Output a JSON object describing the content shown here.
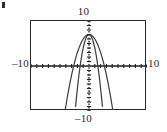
{
  "figure": {
    "kind": "graphing-calculator-viewport",
    "corner_mark": "tick-mark"
  },
  "labels": {
    "top": "10",
    "bottom": "–10",
    "left": "–10",
    "right": "10"
  },
  "chart_data": {
    "type": "line",
    "title": "",
    "subtitle": "",
    "xlabel": "",
    "ylabel": "",
    "xlim": [
      -10,
      10
    ],
    "ylim": [
      -10,
      10
    ],
    "grid": false,
    "legend": "none",
    "axis_style": "dotted-ticks",
    "tick_labels": {
      "x": [
        "–10",
        "10"
      ],
      "y": [
        "–10",
        "10"
      ]
    },
    "axes_drawn": [
      "x-axis at y=0 (solid with tick dots)",
      "y-axis at x=0 (dotted)"
    ],
    "annotations": [],
    "series": [
      {
        "name": "wide parabola",
        "equation": "y = -x^2 + 7",
        "vertex": [
          0,
          7
        ],
        "leading_coefficient": -1,
        "x": [
          -4.1,
          -3.5,
          -3.0,
          -2.5,
          -2.0,
          -1.5,
          -1.0,
          -0.5,
          0.0,
          0.5,
          1.0,
          1.5,
          2.0,
          2.5,
          3.0,
          3.5,
          4.1
        ],
        "values": [
          -9.8,
          -5.3,
          -2.0,
          0.8,
          3.0,
          4.8,
          6.0,
          6.8,
          7.0,
          6.8,
          6.0,
          4.8,
          3.0,
          0.8,
          -2.0,
          -5.3,
          -9.8
        ]
      },
      {
        "name": "narrow parabola",
        "equation": "y = -3x^2 + 7",
        "vertex": [
          0,
          7
        ],
        "leading_coefficient": -3,
        "x": [
          -2.4,
          -2.0,
          -1.6,
          -1.2,
          -0.8,
          -0.4,
          0.0,
          0.4,
          0.8,
          1.2,
          1.6,
          2.0,
          2.4
        ],
        "values": [
          -10.0,
          -5.0,
          -0.7,
          2.7,
          5.1,
          6.5,
          7.0,
          6.5,
          5.1,
          2.7,
          -0.7,
          -5.0,
          -10.0
        ]
      }
    ]
  },
  "colors": {
    "frame": "#2b2b2b",
    "axis": "#1f1f1f",
    "curve": "#3a3a3a",
    "background": "#ffffff",
    "text": "#1f1f1f"
  }
}
